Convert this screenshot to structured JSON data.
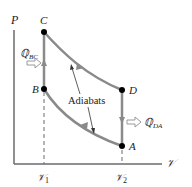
{
  "diagram": {
    "axes": {
      "y_label": "P",
      "x_label": "𝒱"
    },
    "points": {
      "A": "A",
      "B": "B",
      "C": "C",
      "D": "D"
    },
    "volume_ticks": {
      "v1": "𝒱",
      "v1_sub": "1",
      "v2": "𝒱",
      "v2_sub": "2"
    },
    "heat_labels": {
      "q_bc": "ℚ",
      "q_bc_sub": "BC",
      "q_da": "ℚ",
      "q_da_sub": "DA"
    },
    "annotation": "Adiabats",
    "colors": {
      "curve": "#8a8a8a",
      "axis": "#6b6b6b",
      "point": "#000000",
      "arrow_fill": "#ffffff",
      "arrow_stroke": "#9a9a9a"
    }
  }
}
